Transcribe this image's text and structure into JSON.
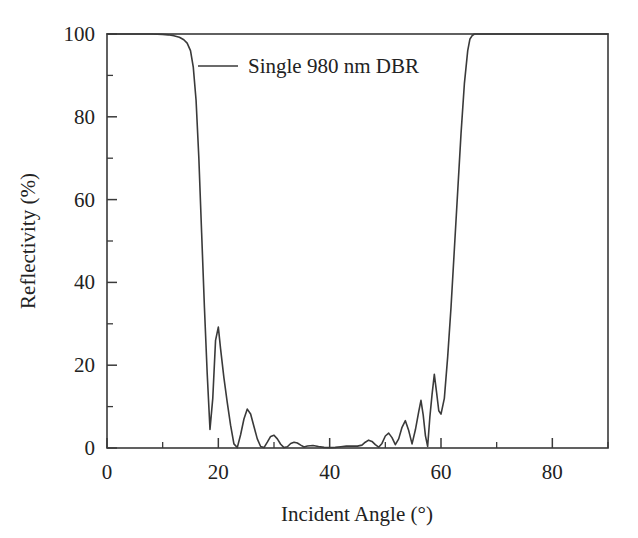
{
  "chart_data": {
    "type": "line",
    "title": "",
    "xlabel": "Incident Angle (°)",
    "ylabel": "Reflectivity (%)",
    "xlim": [
      0,
      90
    ],
    "ylim": [
      0,
      100
    ],
    "xticks": [
      0,
      20,
      40,
      60,
      80
    ],
    "xtick_labels": [
      "0",
      "20",
      "40",
      "60",
      "80"
    ],
    "xticks_minor": [
      10,
      30,
      50,
      70,
      90
    ],
    "yticks": [
      0,
      20,
      40,
      60,
      80,
      100
    ],
    "ytick_labels": [
      "0",
      "20",
      "40",
      "60",
      "80",
      "100"
    ],
    "yticks_minor": [
      10,
      30,
      50,
      70,
      90
    ],
    "grid": false,
    "legend_position": "top-center",
    "line_color": "#3a3a3a",
    "series": [
      {
        "name": "Single 980 nm DBR",
        "x": [
          0,
          2,
          4,
          6,
          8,
          10,
          11,
          12,
          13,
          13.8,
          14.4,
          15,
          15.5,
          16,
          16.5,
          17,
          17.5,
          18,
          18.5,
          19,
          19.5,
          20,
          20.4,
          21,
          21.6,
          22.2,
          22.8,
          23.4,
          24,
          24.6,
          25.2,
          25.8,
          26.4,
          27,
          27.6,
          28.2,
          28.8,
          29.4,
          30,
          30.6,
          31.2,
          31.8,
          32.4,
          33,
          33.6,
          34.2,
          34.8,
          35.4,
          36,
          37,
          38,
          39,
          40,
          41,
          42,
          43,
          44,
          45,
          45.8,
          46.4,
          47,
          47.6,
          48.2,
          48.8,
          49.4,
          50,
          50.6,
          51.2,
          51.8,
          52.4,
          53,
          53.6,
          54.2,
          54.8,
          55.4,
          56,
          56.4,
          56.8,
          57.2,
          57.6,
          58,
          58.4,
          58.8,
          59.2,
          59.6,
          60,
          60.6,
          61.2,
          61.8,
          62.4,
          63,
          63.6,
          64.2,
          64.8,
          65.2,
          65.6,
          66,
          68,
          70,
          75,
          80,
          85,
          90
        ],
        "y": [
          100,
          100,
          100,
          100,
          100,
          99.9,
          99.8,
          99.6,
          99.2,
          98.6,
          97.8,
          96,
          92,
          84,
          70,
          52,
          34,
          18,
          4.5,
          12,
          26,
          29.2,
          24,
          17,
          11,
          5.5,
          1.0,
          0.1,
          3.2,
          7.0,
          9.4,
          8.2,
          5.2,
          2.2,
          0.35,
          0.1,
          1.4,
          2.8,
          3.1,
          2.2,
          0.9,
          0.1,
          0.3,
          1.1,
          1.4,
          1.2,
          0.7,
          0.25,
          0.5,
          0.6,
          0.35,
          0.15,
          0.1,
          0.15,
          0.3,
          0.45,
          0.5,
          0.45,
          0.7,
          1.4,
          1.9,
          1.6,
          0.8,
          0.2,
          1.1,
          2.9,
          3.6,
          2.5,
          0.8,
          2.2,
          5.0,
          6.6,
          4.2,
          1.0,
          4.4,
          8.8,
          11.5,
          8.0,
          3.0,
          0.4,
          7.5,
          13.0,
          17.8,
          13.5,
          9.0,
          8.2,
          12.0,
          22,
          34,
          48,
          62,
          76,
          88,
          96,
          98.8,
          99.6,
          100,
          100,
          100,
          100,
          100,
          100,
          100
        ]
      }
    ]
  },
  "legend": {
    "entries": [
      {
        "label": "Single 980 nm DBR",
        "color": "#3a3a3a"
      }
    ]
  },
  "axes": {
    "x_title": "Incident Angle (°)",
    "y_title": "Reflectivity (%)"
  },
  "colors": {
    "background": "#ffffff",
    "frame": "#3a3a3a",
    "text": "#222222",
    "line": "#3a3a3a"
  }
}
